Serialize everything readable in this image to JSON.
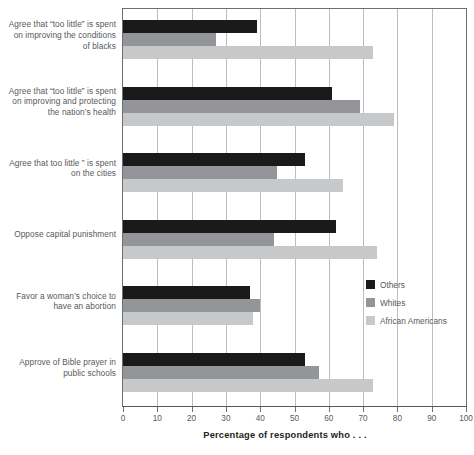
{
  "chart_data": {
    "type": "bar",
    "orientation": "horizontal",
    "title": "",
    "xlabel": "Percentage of respondents who . . .",
    "ylabel": "",
    "xlim": [
      0,
      100
    ],
    "xticks": [
      0,
      10,
      20,
      30,
      40,
      50,
      60,
      70,
      80,
      90,
      100
    ],
    "grid": true,
    "legend_position": "inside-right",
    "categories": [
      "Agree that “too little” is spent on improving the conditions of blacks",
      "Agree that “too little” is spent on improving and protecting the nation’s health",
      "Agree that too little ” is spent on the cities",
      "Oppose capital punishment",
      "Favor a woman’s choice to have an abortion",
      "Approve of Bible prayer in public schools"
    ],
    "category_lines": [
      [
        "Agree that “too little” is spent",
        "on improving the conditions",
        "of blacks"
      ],
      [
        "Agree that “too little” is spent",
        "on improving and protecting",
        "the nation’s health"
      ],
      [
        "Agree that too little ” is spent",
        "on the cities"
      ],
      [
        "Oppose capital punishment"
      ],
      [
        "Favor a woman’s choice to",
        "have an abortion"
      ],
      [
        "Approve of Bible prayer in",
        "public schools"
      ]
    ],
    "series": [
      {
        "name": "Others",
        "color": "#1a1a1a",
        "values": [
          39,
          61,
          53,
          62,
          37,
          53
        ]
      },
      {
        "name": "Whites",
        "color": "#939598",
        "values": [
          27,
          69,
          45,
          44,
          40,
          57
        ]
      },
      {
        "name": "African Americans",
        "color": "#c7c8ca",
        "values": [
          73,
          79,
          64,
          74,
          38,
          73
        ]
      }
    ]
  },
  "legend": {
    "items": [
      {
        "label": "Others",
        "color": "#1a1a1a"
      },
      {
        "label": "Whites",
        "color": "#939598"
      },
      {
        "label": "African Americans",
        "color": "#c7c8ca"
      }
    ]
  },
  "axis": {
    "x_title": "Percentage of respondents who . . .",
    "tick_labels": [
      "0",
      "10",
      "20",
      "30",
      "40",
      "50",
      "60",
      "70",
      "80",
      "90",
      "100"
    ]
  },
  "colors": {
    "others": "#1a1a1a",
    "whites": "#939598",
    "african_americans": "#c7c8ca",
    "grid": "#bcbec0",
    "axis": "#6d6e71",
    "text": "#58595b"
  }
}
